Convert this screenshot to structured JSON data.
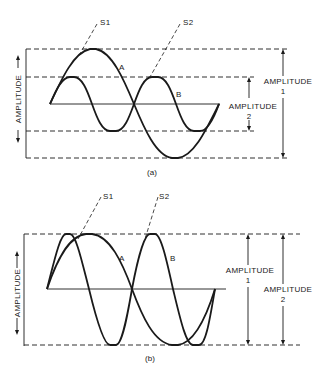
{
  "figure_a": {
    "caption": "(a)",
    "y_axis_label": "AMPLITUDE",
    "signal_labels": {
      "s1": "S1",
      "s2": "S2"
    },
    "wave_labels": {
      "a": "A",
      "b": "B"
    },
    "amplitude_1_label": "AMPLITUDE",
    "amplitude_1_sub": "1",
    "amplitude_2_label": "AMPLITUDE",
    "amplitude_2_sub": "2",
    "description": "Wave A: one cycle, large amplitude. Wave B: two cycles, smaller amplitude (about half of A)."
  },
  "figure_b": {
    "caption": "(b)",
    "y_axis_label": "AMPLITUDE",
    "signal_labels": {
      "s1": "S1",
      "s2": "S2"
    },
    "wave_labels": {
      "a": "A",
      "b": "B"
    },
    "amplitude_1_label": "AMPLITUDE",
    "amplitude_1_sub": "1",
    "amplitude_2_label": "AMPLITUDE",
    "amplitude_2_sub": "2",
    "description": "Wave A: one cycle. Wave B: two cycles. Both waves have equal amplitude."
  },
  "colors": {
    "ink": "#1a1a1a",
    "paper": "#ffffff"
  }
}
